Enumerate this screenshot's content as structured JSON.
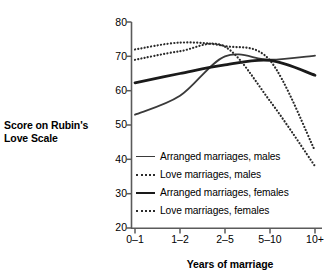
{
  "chart_data": {
    "type": "line",
    "title": "",
    "xlabel": "Years of marriage",
    "ylabel": "Score on Rubin's Love Scale",
    "ylabel_line1": "Score on Rubin's",
    "ylabel_line2": "Love Scale",
    "categories": [
      "0–1",
      "1–2",
      "2–5",
      "5–10",
      "10+"
    ],
    "ylim": [
      20,
      80
    ],
    "yticks": [
      20,
      30,
      40,
      50,
      60,
      70,
      80
    ],
    "grid": false,
    "legend_position": "inside-lower-left",
    "series": [
      {
        "name": "Arranged marriages, males",
        "style": "solid-thin",
        "color": "#3a3a3a",
        "values": [
          53.0,
          58.5,
          70.0,
          69.0,
          70.2
        ]
      },
      {
        "name": "Love marriages, males",
        "style": "dotted",
        "color": "#2b2b2b",
        "values": [
          72.0,
          74.0,
          73.0,
          68.8,
          42.5
        ]
      },
      {
        "name": "Arranged marriages, females",
        "style": "solid-thick",
        "color": "#1a1a1a",
        "values": [
          62.3,
          65.0,
          67.5,
          68.8,
          64.5
        ]
      },
      {
        "name": "Love marriages, females",
        "style": "dotted",
        "color": "#2b2b2b",
        "values": [
          69.0,
          71.5,
          72.8,
          57.0,
          38.0
        ]
      }
    ]
  },
  "axis": {
    "y_tick_labels": [
      "80",
      "70",
      "60",
      "50",
      "40",
      "30",
      "20"
    ],
    "x_tick_labels": [
      "0–1",
      "1–2",
      "2–5",
      "5–10",
      "10+"
    ],
    "x_title": "Years of marriage",
    "y_title_line1": "Score on Rubin's",
    "y_title_line2": "Love Scale"
  },
  "legend": {
    "items": [
      {
        "label": "Arranged marriages, males",
        "style": "solid-thin"
      },
      {
        "label": "Love marriages, males",
        "style": "dotted"
      },
      {
        "label": "Arranged marriages, females",
        "style": "solid-thick"
      },
      {
        "label": "Love marriages, females",
        "style": "dotted"
      }
    ]
  },
  "colors": {
    "axis": "#5a5a5a",
    "text": "#000000",
    "line_thin": "#3a3a3a",
    "line_thick": "#1a1a1a",
    "line_dotted": "#2b2b2b",
    "background": "#ffffff"
  }
}
